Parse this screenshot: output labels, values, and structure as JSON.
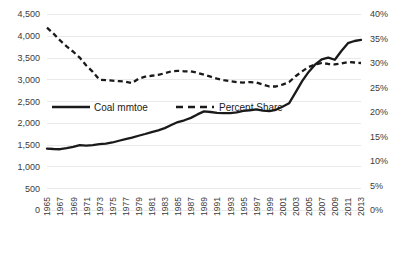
{
  "chart_data": {
    "type": "line",
    "title": "",
    "xlabel": "",
    "ylabel": "",
    "y2label": "",
    "grid": true,
    "legend_position": "inside-upper-left",
    "x": [
      1965,
      1966,
      1967,
      1968,
      1969,
      1970,
      1971,
      1972,
      1973,
      1974,
      1975,
      1976,
      1977,
      1978,
      1979,
      1980,
      1981,
      1982,
      1983,
      1984,
      1985,
      1986,
      1987,
      1988,
      1989,
      1990,
      1991,
      1992,
      1993,
      1994,
      1995,
      1996,
      1997,
      1998,
      1999,
      2000,
      2001,
      2002,
      2003,
      2004,
      2005,
      2006,
      2007,
      2008,
      2009,
      2010,
      2011,
      2012,
      2013
    ],
    "xtick_labels": [
      "1965",
      "1967",
      "1969",
      "1971",
      "1973",
      "1975",
      "1977",
      "1979",
      "1981",
      "1983",
      "1985",
      "1987",
      "1989",
      "1991",
      "1993",
      "1995",
      "1997",
      "1999",
      "2001",
      "2003",
      "2005",
      "2007",
      "2009",
      "2011",
      "2013"
    ],
    "ylim": [
      0,
      4500
    ],
    "ytick_labels": [
      "0",
      "500",
      "1,000",
      "1,500",
      "2,000",
      "2,500",
      "3,000",
      "3,500",
      "4,000",
      "4,500"
    ],
    "ytick_values": [
      0,
      500,
      1000,
      1500,
      2000,
      2500,
      3000,
      3500,
      4000,
      4500
    ],
    "y2lim": [
      0,
      40
    ],
    "y2tick_labels": [
      "0%",
      "5%",
      "10%",
      "15%",
      "20%",
      "25%",
      "30%",
      "35%",
      "40%"
    ],
    "y2tick_values": [
      0,
      5,
      10,
      15,
      20,
      25,
      30,
      35,
      40
    ],
    "series": [
      {
        "name": "Coal mmtoe",
        "style": "solid",
        "axis": "left",
        "color": "#1a1a1a",
        "values": [
          1410,
          1400,
          1395,
          1420,
          1450,
          1490,
          1480,
          1490,
          1510,
          1525,
          1550,
          1590,
          1625,
          1660,
          1705,
          1745,
          1790,
          1830,
          1880,
          1950,
          2020,
          2060,
          2115,
          2195,
          2265,
          2250,
          2230,
          2225,
          2225,
          2240,
          2275,
          2290,
          2310,
          2280,
          2270,
          2300,
          2370,
          2450,
          2700,
          2960,
          3170,
          3340,
          3460,
          3500,
          3450,
          3650,
          3830,
          3880,
          3905
        ]
      },
      {
        "name": "Percent Share",
        "style": "dashed",
        "axis": "right",
        "color": "#1a1a1a",
        "values": [
          37.2,
          36.0,
          34.6,
          33.4,
          32.3,
          31.1,
          29.5,
          28.2,
          26.6,
          26.5,
          26.4,
          26.3,
          26.2,
          25.9,
          26.8,
          27.2,
          27.4,
          27.6,
          27.9,
          28.3,
          28.4,
          28.3,
          28.3,
          28.0,
          27.6,
          27.2,
          26.8,
          26.5,
          26.3,
          26.1,
          26.0,
          26.1,
          26.0,
          25.6,
          25.2,
          25.2,
          25.6,
          26.1,
          27.3,
          28.3,
          29.2,
          29.7,
          30.0,
          29.8,
          29.7,
          29.9,
          30.2,
          30.1,
          30.0
        ]
      }
    ]
  },
  "legend": {
    "items": [
      {
        "label": "Coal mmtoe",
        "style": "solid"
      },
      {
        "label": "Percent Share",
        "style": "dashed"
      }
    ]
  },
  "colors": {
    "series": "#1a1a1a",
    "gridline": "#e9e9e9",
    "tick_text": "#3b3b3b",
    "background": "#ffffff"
  }
}
